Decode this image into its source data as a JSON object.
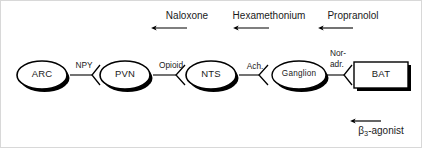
{
  "diagram": {
    "nodes": [
      {
        "id": "arc",
        "label": "ARC",
        "shape": "ellipse",
        "cx": 41,
        "cy": 74,
        "rx": 25,
        "ry": 14
      },
      {
        "id": "pvn",
        "label": "PVN",
        "shape": "ellipse",
        "cx": 124,
        "cy": 74,
        "rx": 25,
        "ry": 14
      },
      {
        "id": "nts",
        "label": "NTS",
        "shape": "ellipse",
        "cx": 210,
        "cy": 74,
        "rx": 25,
        "ry": 14
      },
      {
        "id": "ganglion",
        "label": "Ganglion",
        "shape": "ellipse",
        "cx": 298,
        "cy": 74,
        "rx": 27,
        "ry": 14
      },
      {
        "id": "bat",
        "label": "BAT",
        "shape": "rect",
        "x": 353,
        "y": 61,
        "w": 54,
        "h": 26
      }
    ],
    "transmitters": [
      {
        "id": "npy",
        "label": "NPY",
        "x": 83,
        "y": 60
      },
      {
        "id": "opioid",
        "label": "Opioid",
        "x": 170,
        "y": 60
      },
      {
        "id": "ach",
        "label": "Ach.",
        "x": 254,
        "y": 61
      },
      {
        "id": "noradr",
        "label": "Nor-",
        "label2": "adr.",
        "x": 340,
        "y": 52
      }
    ],
    "blockers": [
      {
        "id": "naloxone",
        "label": "Naloxone",
        "x": 186,
        "y": 10,
        "arrow_x": 186,
        "arrow_y1": 27,
        "arrow_y2": 62
      },
      {
        "id": "hexamethonium",
        "label": "Hexamethonium",
        "x": 268,
        "y": 10,
        "arrow_x": 268,
        "arrow_y1": 27,
        "arrow_y2": 62
      },
      {
        "id": "propranolol",
        "label": "Propranolol",
        "x": 352,
        "y": 10,
        "arrow_x": 352,
        "arrow_y1": 27,
        "arrow_y2": 61
      }
    ],
    "agonist": {
      "id": "beta3-agonist",
      "label_prefix": "β",
      "label_sub": "3",
      "label_suffix": "-agonist",
      "x": 380,
      "y": 126,
      "arrow_x": 380,
      "arrow_y1": 120,
      "arrow_y2": 90
    },
    "colors": {
      "stroke": "#000000",
      "text": "#1a1a1a",
      "background": "#ffffff",
      "shadow": "#000000",
      "frame": "#d8d8d8"
    }
  }
}
